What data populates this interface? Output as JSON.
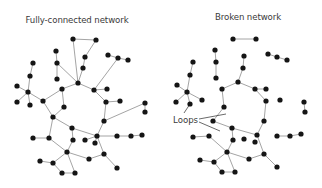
{
  "panels": [
    {
      "id": "fully-connected",
      "title": "Fully-connected network",
      "title_pos": [
        77,
        24
      ],
      "nodes": [
        [
          73,
          39
        ],
        [
          96,
          40
        ],
        [
          56,
          51
        ],
        [
          57,
          63
        ],
        [
          57,
          79
        ],
        [
          85,
          57
        ],
        [
          83,
          68
        ],
        [
          78,
          83
        ],
        [
          108,
          55
        ],
        [
          118,
          58
        ],
        [
          128,
          60
        ],
        [
          33,
          63
        ],
        [
          30,
          76
        ],
        [
          17,
          86
        ],
        [
          28,
          92
        ],
        [
          17,
          102
        ],
        [
          30,
          105
        ],
        [
          43,
          101
        ],
        [
          62,
          89
        ],
        [
          64,
          107
        ],
        [
          94,
          90
        ],
        [
          107,
          89
        ],
        [
          106,
          102
        ],
        [
          120,
          101
        ],
        [
          145,
          103
        ],
        [
          145,
          112
        ],
        [
          53,
          117
        ],
        [
          49,
          138
        ],
        [
          33,
          138
        ],
        [
          72,
          128
        ],
        [
          73,
          140
        ],
        [
          67,
          152
        ],
        [
          53,
          163
        ],
        [
          40,
          161
        ],
        [
          62,
          173
        ],
        [
          75,
          173
        ],
        [
          104,
          121
        ],
        [
          97,
          136
        ],
        [
          85,
          140
        ],
        [
          95,
          143
        ],
        [
          117,
          136
        ],
        [
          131,
          136
        ],
        [
          142,
          135
        ],
        [
          104,
          154
        ],
        [
          89,
          159
        ],
        [
          117,
          168
        ]
      ],
      "edges": [
        [
          0,
          1
        ],
        [
          0,
          7
        ],
        [
          1,
          5
        ],
        [
          5,
          6
        ],
        [
          6,
          7
        ],
        [
          2,
          3
        ],
        [
          3,
          7
        ],
        [
          4,
          3
        ],
        [
          8,
          9
        ],
        [
          9,
          10
        ],
        [
          9,
          20
        ],
        [
          11,
          12
        ],
        [
          12,
          14
        ],
        [
          13,
          14
        ],
        [
          14,
          16
        ],
        [
          14,
          17
        ],
        [
          15,
          14
        ],
        [
          17,
          18
        ],
        [
          18,
          7
        ],
        [
          18,
          19
        ],
        [
          17,
          26
        ],
        [
          19,
          26
        ],
        [
          7,
          20
        ],
        [
          20,
          21
        ],
        [
          20,
          22
        ],
        [
          22,
          23
        ],
        [
          22,
          36
        ],
        [
          36,
          24
        ],
        [
          24,
          25
        ],
        [
          26,
          27
        ],
        [
          27,
          28
        ],
        [
          27,
          31
        ],
        [
          26,
          29
        ],
        [
          29,
          30
        ],
        [
          30,
          31
        ],
        [
          31,
          32
        ],
        [
          32,
          33
        ],
        [
          32,
          34
        ],
        [
          34,
          35
        ],
        [
          35,
          31
        ],
        [
          31,
          44
        ],
        [
          44,
          43
        ],
        [
          43,
          45
        ],
        [
          36,
          37
        ],
        [
          37,
          43
        ],
        [
          29,
          37
        ],
        [
          37,
          40
        ],
        [
          40,
          41
        ],
        [
          41,
          42
        ],
        [
          38,
          37
        ],
        [
          39,
          37
        ]
      ]
    },
    {
      "id": "broken",
      "title": "Broken network",
      "title_pos": [
        248,
        21
      ],
      "nodes": [
        [
          233,
          39
        ],
        [
          256,
          39
        ],
        [
          215,
          50
        ],
        [
          216,
          62
        ],
        [
          216,
          78
        ],
        [
          244,
          56
        ],
        [
          243,
          68
        ],
        [
          238,
          82
        ],
        [
          268,
          54
        ],
        [
          277,
          57
        ],
        [
          287,
          60
        ],
        [
          193,
          62
        ],
        [
          190,
          75
        ],
        [
          177,
          85
        ],
        [
          187,
          92
        ],
        [
          176,
          102
        ],
        [
          190,
          104
        ],
        [
          202,
          100
        ],
        [
          222,
          89
        ],
        [
          224,
          107
        ],
        [
          255,
          89
        ],
        [
          266,
          89
        ],
        [
          266,
          101
        ],
        [
          280,
          100
        ],
        [
          304,
          102
        ],
        [
          305,
          112
        ],
        [
          213,
          121
        ],
        [
          209,
          136
        ],
        [
          193,
          137
        ],
        [
          232,
          128
        ],
        [
          233,
          140
        ],
        [
          227,
          152
        ],
        [
          214,
          162
        ],
        [
          200,
          160
        ],
        [
          222,
          172
        ],
        [
          235,
          172
        ],
        [
          264,
          121
        ],
        [
          257,
          135
        ],
        [
          244,
          139
        ],
        [
          255,
          142
        ],
        [
          277,
          136
        ],
        [
          290,
          136
        ],
        [
          301,
          134
        ],
        [
          264,
          154
        ],
        [
          249,
          159
        ],
        [
          277,
          167
        ]
      ],
      "edges": [
        [
          0,
          1
        ],
        [
          2,
          3
        ],
        [
          3,
          4
        ],
        [
          5,
          6
        ],
        [
          6,
          7
        ],
        [
          8,
          9
        ],
        [
          9,
          10
        ],
        [
          11,
          12
        ],
        [
          12,
          14
        ],
        [
          13,
          14
        ],
        [
          14,
          16
        ],
        [
          14,
          17
        ],
        [
          15,
          14
        ],
        [
          7,
          18
        ],
        [
          7,
          20
        ],
        [
          18,
          19
        ],
        [
          19,
          26
        ],
        [
          20,
          21
        ],
        [
          20,
          22
        ],
        [
          22,
          36
        ],
        [
          24,
          25
        ],
        [
          26,
          29
        ],
        [
          29,
          30
        ],
        [
          30,
          31
        ],
        [
          27,
          28
        ],
        [
          27,
          31
        ],
        [
          31,
          32
        ],
        [
          32,
          33
        ],
        [
          32,
          34
        ],
        [
          34,
          35
        ],
        [
          35,
          31
        ],
        [
          31,
          44
        ],
        [
          44,
          43
        ],
        [
          43,
          45
        ],
        [
          36,
          37
        ],
        [
          37,
          43
        ],
        [
          29,
          37
        ],
        [
          40,
          41
        ],
        [
          41,
          42
        ]
      ],
      "annotation": {
        "label": "Loops",
        "label_pos": [
          173,
          115
        ],
        "pointers": [
          [
            199,
            119,
            226,
            114
          ],
          [
            199,
            122,
            220,
            131
          ],
          [
            184,
            113,
            190,
            104
          ]
        ]
      }
    }
  ],
  "colors": {
    "node": "#151515",
    "edge": "#9a9a9a",
    "text": "#3a3a3a",
    "background": "#ffffff"
  }
}
